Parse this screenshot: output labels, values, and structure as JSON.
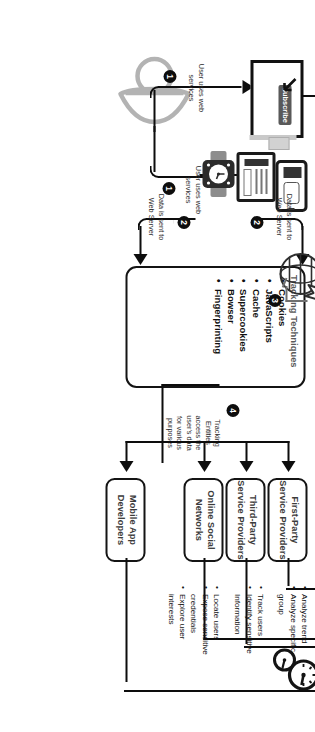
{
  "diagram": {
    "colors": {
      "ink": "#0d0d0d",
      "box_text": "#3b3b3b",
      "accent_gray": "#595959"
    }
  },
  "steps": [
    {
      "id": "1",
      "label": "User uses web services"
    },
    {
      "id": "1",
      "label": "User uses web services"
    },
    {
      "id": "2",
      "label": "Data is sent to Web Server"
    },
    {
      "id": "2",
      "label": "Data is sent to Web Server"
    },
    {
      "id": "3",
      "label": "Tracking Techniques are deployed by Web Servers"
    },
    {
      "id": "4",
      "label": "Tracking Entities access the user's data for various purposes"
    },
    {
      "id": "5",
      "label": ""
    }
  ],
  "badges": {
    "one": "1",
    "two": "2",
    "three": "3",
    "four": "4",
    "five": "5"
  },
  "captions": {
    "user_uses_left": "User uses web\nservices",
    "user_uses_right": "User uses web\nservices",
    "data_sent_left": "Data is sent to\nWeb Server",
    "data_sent_right": "Data is sent to\nWeb Server",
    "deployed_note": "Tracking\nTechniques are\ndeployed by Web\nServers",
    "entities_note": "Tracking\nEntities\naccess the\nuser's data\nfor various\npurposes"
  },
  "tracking_techniques": {
    "title": "Tracking Techniques",
    "items": [
      "Cookies",
      "JavaScripts",
      "Cache",
      "Supercookies",
      "Bowser",
      "Fingerprinting"
    ]
  },
  "entities": [
    {
      "name": "First-Party Service Providers",
      "line1": "First-Party",
      "line2": "Service Providers"
    },
    {
      "name": "Third-Party Service Providers",
      "line1": "Third-Party",
      "line2": "Service Providers"
    },
    {
      "name": "Online Social Networks",
      "line1": "Online Social",
      "line2": "Networks"
    },
    {
      "name": "Mobile App Developers",
      "line1": "Mobile App",
      "line2": "Developers"
    }
  ],
  "purposes": [
    {
      "group": "first-party",
      "items": [
        "Analyze trend",
        "Analyze specific group"
      ]
    },
    {
      "group": "third-party",
      "items": [
        "Track users",
        "Identify sensitive Information"
      ]
    },
    {
      "group": "social-mobile",
      "items": [
        "Locate users",
        "Expose sensitive credentials",
        "Explore user interests"
      ]
    }
  ],
  "purpose_text": {
    "p1a": "Analyze trend",
    "p1b": "Analyze specific",
    "p1c": "group",
    "p2a": "Track users",
    "p2b": "Identify sensitive",
    "p2c": "Information",
    "p3a": "Locate users",
    "p3b": "Expose sensitive",
    "p3c": "credentials",
    "p3d": "Explore user",
    "p3e": "interests"
  },
  "device_labels": {
    "subscribe_button": "Subscribe"
  },
  "icons": [
    "user-icon",
    "desktop-monitor-icon",
    "smartphone-icon",
    "tablet-icon",
    "smartwatch-icon",
    "globe-web-server-icon",
    "analytics-magnifier-icon",
    "network-graph-icon",
    "dashboard-gauges-icon",
    "presentation-report-icon",
    "cursor-pointer-icon"
  ]
}
